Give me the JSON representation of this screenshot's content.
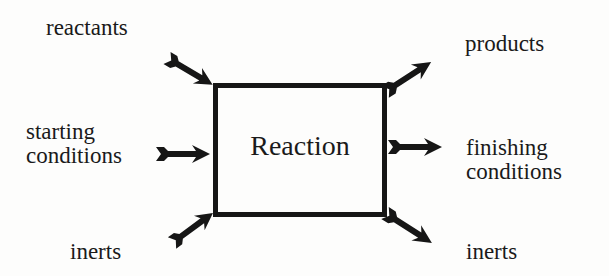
{
  "diagram": {
    "center": {
      "label": "Reaction"
    },
    "inputs": [
      {
        "id": "reactants",
        "label": "reactants"
      },
      {
        "id": "starting",
        "label_lines": [
          "starting",
          "conditions"
        ]
      },
      {
        "id": "inerts-in",
        "label": "inerts"
      }
    ],
    "outputs": [
      {
        "id": "products",
        "label": "products"
      },
      {
        "id": "finishing",
        "label_lines": [
          "finishing",
          "conditions"
        ]
      },
      {
        "id": "inerts-out",
        "label": "inerts"
      }
    ],
    "colors": {
      "ink": "#161616",
      "background": "#fdfdfc"
    }
  }
}
